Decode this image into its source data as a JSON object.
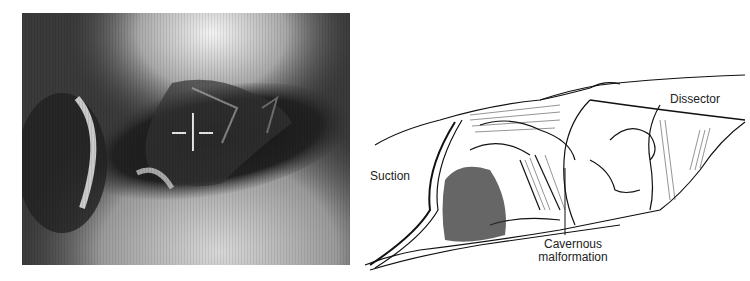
{
  "figure": {
    "left_panel": {
      "type": "intraoperative-photograph",
      "overlay": "crosshair"
    },
    "right_panel": {
      "type": "line-illustration",
      "labels": {
        "suction": "Suction",
        "dissector": "Dissector",
        "cavernous_line1": "Cavernous",
        "cavernous_line2": "malformation"
      }
    }
  }
}
